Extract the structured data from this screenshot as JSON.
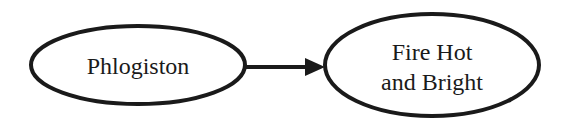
{
  "diagram": {
    "nodes": [
      {
        "id": "phlogiston",
        "lines": [
          "Phlogiston"
        ]
      },
      {
        "id": "fire",
        "lines": [
          "Fire Hot",
          "and Bright"
        ]
      }
    ],
    "edges": [
      {
        "from": "phlogiston",
        "to": "fire"
      }
    ],
    "colors": {
      "stroke": "#1a1a1a",
      "background": "#ffffff"
    }
  }
}
